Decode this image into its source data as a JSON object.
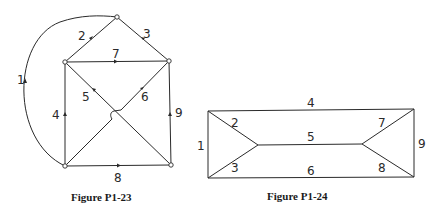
{
  "figures": [
    {
      "caption": "Figure P1-23",
      "type": "directed_graph",
      "nodes": [
        "top",
        "upper-left",
        "upper-right",
        "lower-left",
        "lower-right"
      ],
      "edges": [
        {
          "label": "1",
          "from": "lower-left",
          "to": "top",
          "shape": "arc"
        },
        {
          "label": "2",
          "from": "upper-left",
          "to": "top"
        },
        {
          "label": "3",
          "from": "upper-right",
          "to": "top"
        },
        {
          "label": "4",
          "from": "lower-left",
          "to": "upper-left"
        },
        {
          "label": "5",
          "from": "lower-right",
          "to": "upper-left"
        },
        {
          "label": "6",
          "from": "lower-left",
          "to": "upper-right",
          "note": "crosses over edge 5"
        },
        {
          "label": "7",
          "from": "upper-left",
          "to": "upper-right"
        },
        {
          "label": "8",
          "from": "lower-left",
          "to": "lower-right"
        },
        {
          "label": "9",
          "from": "lower-right",
          "to": "upper-right"
        }
      ]
    },
    {
      "caption": "Figure P1-24",
      "type": "undirected_graph",
      "nodes": [
        "top-left",
        "bottom-left",
        "inner-left",
        "inner-right",
        "top-right",
        "bottom-right"
      ],
      "edges": [
        {
          "label": "1",
          "from": "top-left",
          "to": "bottom-left"
        },
        {
          "label": "2",
          "from": "top-left",
          "to": "inner-left"
        },
        {
          "label": "3",
          "from": "bottom-left",
          "to": "inner-left"
        },
        {
          "label": "4",
          "from": "top-left",
          "to": "top-right"
        },
        {
          "label": "5",
          "from": "inner-left",
          "to": "inner-right"
        },
        {
          "label": "6",
          "from": "bottom-left",
          "to": "bottom-right"
        },
        {
          "label": "7",
          "from": "inner-right",
          "to": "top-right"
        },
        {
          "label": "8",
          "from": "inner-right",
          "to": "bottom-right"
        },
        {
          "label": "9",
          "from": "top-right",
          "to": "bottom-right"
        }
      ]
    }
  ],
  "labels": {
    "f1": {
      "e1": "1",
      "e2": "2",
      "e3": "3",
      "e4": "4",
      "e5": "5",
      "e6": "6",
      "e7": "7",
      "e8": "8",
      "e9": "9"
    },
    "f2": {
      "e1": "1",
      "e2": "2",
      "e3": "3",
      "e4": "4",
      "e5": "5",
      "e6": "6",
      "e7": "7",
      "e8": "8",
      "e9": "9"
    }
  },
  "captions": {
    "f1": "Figure P1-23",
    "f2": "Figure P1-24"
  }
}
